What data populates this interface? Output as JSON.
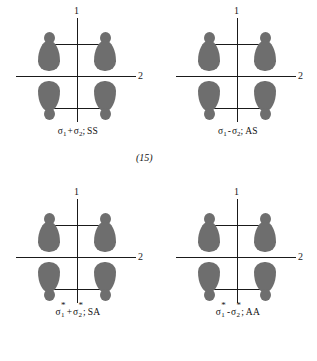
{
  "figure": {
    "axes": {
      "vertical_label": "1",
      "horizontal_label": "2"
    },
    "lobe_color": "#6e6e6e",
    "axis_color": "#1a1a1a",
    "background": "#ffffff"
  },
  "blocks": [
    {
      "equation_number": "(15)",
      "panels": [
        {
          "id": "sigma1-plus-sigma2",
          "sigma_left": "σ",
          "sub_left": "1",
          "operator": "+",
          "sigma_right": "σ",
          "sub_right": "2",
          "separator": ";",
          "symmetry": "SS",
          "starred": false,
          "axis_v": "1",
          "axis_h": "2"
        },
        {
          "id": "sigma1-minus-sigma2",
          "sigma_left": "σ",
          "sub_left": "1",
          "operator": "-",
          "sigma_right": "σ",
          "sub_right": "2",
          "separator": ";",
          "symmetry": "AS",
          "starred": false,
          "axis_v": "1",
          "axis_h": "2"
        }
      ]
    },
    {
      "equation_number": "(16)",
      "panels": [
        {
          "id": "sigma1star-plus-sigma2star",
          "sigma_left": "σ",
          "star_left": "*",
          "sub_left": "1",
          "operator": "+",
          "sigma_right": "σ",
          "star_right": "*",
          "sub_right": "2",
          "separator": ";",
          "symmetry": "SA",
          "starred": true,
          "axis_v": "1",
          "axis_h": "2"
        },
        {
          "id": "sigma1star-minus-sigma2star",
          "sigma_left": "σ",
          "star_left": "*",
          "sub_left": "1",
          "operator": "-",
          "sigma_right": "σ",
          "star_right": "*",
          "sub_right": "2",
          "separator": ";",
          "symmetry": "AA",
          "starred": true,
          "axis_v": "1",
          "axis_h": "2"
        }
      ]
    }
  ]
}
